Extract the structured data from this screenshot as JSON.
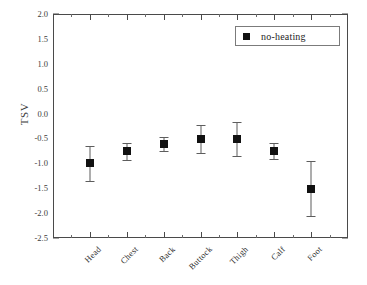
{
  "chart_data": {
    "type": "scatter",
    "title": "",
    "xlabel": "",
    "ylabel": "TSV",
    "categories": [
      "Head",
      "Chest",
      "Back",
      "Buttock",
      "Thigh",
      "Calf",
      "Foot"
    ],
    "values": [
      -1.0,
      -0.76,
      -0.61,
      -0.51,
      -0.51,
      -0.76,
      -1.51
    ],
    "errors": [
      0.35,
      0.17,
      0.14,
      0.29,
      0.34,
      0.16,
      0.55
    ],
    "series": [
      {
        "name": "no-heating",
        "marker": "filled-square",
        "color": "#111111",
        "values": [
          -1.0,
          -0.76,
          -0.61,
          -0.51,
          -0.51,
          -0.76,
          -1.51
        ],
        "errors": [
          0.35,
          0.17,
          0.14,
          0.29,
          0.34,
          0.16,
          0.55
        ]
      }
    ],
    "ylim": [
      -2.5,
      2.0
    ],
    "ytick_labels": [
      "2.0",
      "1.5",
      "1.0",
      "0.5",
      "0.0",
      "-0.5",
      "-1.0",
      "-1.5",
      "-2.0",
      "-2.5"
    ],
    "ytick_values": [
      2.0,
      1.5,
      1.0,
      0.5,
      0.0,
      -0.5,
      -1.0,
      -1.5,
      -2.0,
      -2.5
    ],
    "grid": false,
    "legend_position": "top-right",
    "legend_entries": [
      "no-heating"
    ]
  },
  "legend": {
    "label": "no-heating"
  },
  "axes": {
    "y_title": "TSV"
  }
}
